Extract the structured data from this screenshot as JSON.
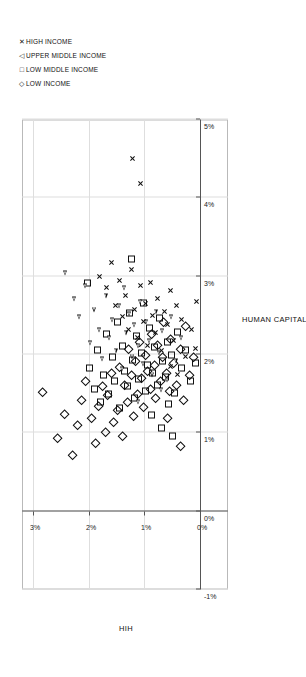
{
  "chart_data": {
    "type": "scatter",
    "title": "",
    "xlabel": "HUMAN CAPITAL PER CAPITA",
    "ylabel": "HIH",
    "xlim": [
      -0.01,
      0.05
    ],
    "ylim": [
      -0.005,
      0.032
    ],
    "xticks": [
      "-1%",
      "0%",
      "1%",
      "2%",
      "3%",
      "4%",
      "5%"
    ],
    "yticks": [
      "0%",
      "1%",
      "2%",
      "3%"
    ],
    "grid": true,
    "legend_position": "top-right",
    "series": [
      {
        "name": "LOW INCOME",
        "marker": "diamond",
        "color": "#111111",
        "points": [
          [
            0.015,
            0.0285
          ],
          [
            0.0092,
            0.0258
          ],
          [
            0.0123,
            0.0246
          ],
          [
            0.007,
            0.0232
          ],
          [
            0.0108,
            0.0222
          ],
          [
            0.014,
            0.0215
          ],
          [
            0.0165,
            0.0208
          ],
          [
            0.0118,
            0.0198
          ],
          [
            0.0085,
            0.019
          ],
          [
            0.0133,
            0.0185
          ],
          [
            0.0158,
            0.0178
          ],
          [
            0.01,
            0.0172
          ],
          [
            0.0147,
            0.0168
          ],
          [
            0.0175,
            0.0162
          ],
          [
            0.0112,
            0.0158
          ],
          [
            0.0128,
            0.015
          ],
          [
            0.0182,
            0.0147
          ],
          [
            0.0095,
            0.0142
          ],
          [
            0.016,
            0.0138
          ],
          [
            0.0138,
            0.0133
          ],
          [
            0.0205,
            0.013
          ],
          [
            0.0172,
            0.0126
          ],
          [
            0.012,
            0.0122
          ],
          [
            0.019,
            0.0118
          ],
          [
            0.0148,
            0.0115
          ],
          [
            0.0215,
            0.0112
          ],
          [
            0.0168,
            0.0108
          ],
          [
            0.0132,
            0.0104
          ],
          [
            0.0198,
            0.01
          ],
          [
            0.0178,
            0.0096
          ],
          [
            0.0155,
            0.0092
          ],
          [
            0.0225,
            0.009
          ],
          [
            0.0185,
            0.0085
          ],
          [
            0.0143,
            0.0082
          ],
          [
            0.021,
            0.0078
          ],
          [
            0.0165,
            0.0074
          ],
          [
            0.0195,
            0.007
          ],
          [
            0.024,
            0.0068
          ],
          [
            0.0175,
            0.0062
          ],
          [
            0.0152,
            0.0058
          ],
          [
            0.0218,
            0.0055
          ],
          [
            0.0188,
            0.005
          ],
          [
            0.016,
            0.0044
          ],
          [
            0.0205,
            0.0038
          ],
          [
            0.014,
            0.0032
          ],
          [
            0.0235,
            0.0028
          ],
          [
            0.0172,
            0.0022
          ],
          [
            0.0195,
            0.0014
          ],
          [
            0.0118,
            0.006
          ],
          [
            0.0082,
            0.0038
          ]
        ]
      },
      {
        "name": "LOW MIDDLE INCOME",
        "marker": "square",
        "color": "#111111",
        "points": [
          [
            0.029,
            0.0205
          ],
          [
            0.0182,
            0.02
          ],
          [
            0.0155,
            0.0192
          ],
          [
            0.0205,
            0.0186
          ],
          [
            0.0138,
            0.018
          ],
          [
            0.0172,
            0.0175
          ],
          [
            0.0225,
            0.017
          ],
          [
            0.0148,
            0.0166
          ],
          [
            0.0195,
            0.016
          ],
          [
            0.0165,
            0.0155
          ],
          [
            0.024,
            0.015
          ],
          [
            0.013,
            0.0146
          ],
          [
            0.021,
            0.0142
          ],
          [
            0.0178,
            0.0138
          ],
          [
            0.0158,
            0.0132
          ],
          [
            0.0252,
            0.0128
          ],
          [
            0.0192,
            0.0124
          ],
          [
            0.0143,
            0.012
          ],
          [
            0.0222,
            0.0116
          ],
          [
            0.0168,
            0.0112
          ],
          [
            0.02,
            0.0108
          ],
          [
            0.0265,
            0.0104
          ],
          [
            0.0152,
            0.01
          ],
          [
            0.0185,
            0.0096
          ],
          [
            0.0232,
            0.0092
          ],
          [
            0.0175,
            0.0088
          ],
          [
            0.0208,
            0.0084
          ],
          [
            0.016,
            0.0078
          ],
          [
            0.0245,
            0.0074
          ],
          [
            0.019,
            0.007
          ],
          [
            0.017,
            0.0064
          ],
          [
            0.0215,
            0.006
          ],
          [
            0.0198,
            0.0054
          ],
          [
            0.015,
            0.0048
          ],
          [
            0.0228,
            0.0042
          ],
          [
            0.0182,
            0.0036
          ],
          [
            0.0205,
            0.0028
          ],
          [
            0.0165,
            0.002
          ],
          [
            0.0188,
            0.001
          ],
          [
            0.0122,
            0.009
          ],
          [
            0.0105,
            0.0072
          ],
          [
            0.0135,
            0.0058
          ],
          [
            0.032,
            0.0125
          ],
          [
            0.0095,
            0.0052
          ]
        ]
      },
      {
        "name": "UPPER MIDDLE INCOME",
        "marker": "triangle",
        "color": "#111111",
        "points": [
          [
            0.0305,
            0.024
          ],
          [
            0.0272,
            0.0225
          ],
          [
            0.0248,
            0.0215
          ],
          [
            0.0288,
            0.0205
          ],
          [
            0.0215,
            0.0196
          ],
          [
            0.0258,
            0.0188
          ],
          [
            0.0232,
            0.018
          ],
          [
            0.0195,
            0.0174
          ],
          [
            0.0275,
            0.0168
          ],
          [
            0.0222,
            0.0162
          ],
          [
            0.0245,
            0.0156
          ],
          [
            0.0205,
            0.015
          ],
          [
            0.0262,
            0.0144
          ],
          [
            0.0182,
            0.0138
          ],
          [
            0.0228,
            0.0132
          ],
          [
            0.0252,
            0.0126
          ],
          [
            0.0198,
            0.012
          ],
          [
            0.0238,
            0.0116
          ],
          [
            0.0212,
            0.011
          ],
          [
            0.0268,
            0.0106
          ],
          [
            0.0188,
            0.01
          ],
          [
            0.0242,
            0.0095
          ],
          [
            0.0218,
            0.009
          ],
          [
            0.0175,
            0.0084
          ],
          [
            0.0255,
            0.0078
          ],
          [
            0.0202,
            0.0072
          ],
          [
            0.023,
            0.0066
          ],
          [
            0.0168,
            0.0058
          ],
          [
            0.0248,
            0.005
          ],
          [
            0.0192,
            0.0042
          ],
          [
            0.0222,
            0.0032
          ],
          [
            0.0155,
            0.0068
          ],
          [
            0.014,
            0.011
          ],
          [
            0.0285,
            0.0135
          ]
        ]
      },
      {
        "name": "HIGH INCOME",
        "marker": "x",
        "color": "#111111",
        "points": [
          [
            0.045,
            0.0122
          ],
          [
            0.0418,
            0.0108
          ],
          [
            0.03,
            0.018
          ],
          [
            0.0285,
            0.0168
          ],
          [
            0.0318,
            0.016
          ],
          [
            0.0262,
            0.0152
          ],
          [
            0.0295,
            0.0145
          ],
          [
            0.0248,
            0.014
          ],
          [
            0.0275,
            0.0134
          ],
          [
            0.0232,
            0.0128
          ],
          [
            0.0308,
            0.0124
          ],
          [
            0.0258,
            0.0118
          ],
          [
            0.0222,
            0.0112
          ],
          [
            0.0288,
            0.0108
          ],
          [
            0.0242,
            0.0102
          ],
          [
            0.0265,
            0.0098
          ],
          [
            0.0212,
            0.0094
          ],
          [
            0.0292,
            0.009
          ],
          [
            0.025,
            0.0086
          ],
          [
            0.0228,
            0.008
          ],
          [
            0.0272,
            0.0076
          ],
          [
            0.0205,
            0.007
          ],
          [
            0.0255,
            0.0064
          ],
          [
            0.0238,
            0.0058
          ],
          [
            0.0282,
            0.0054
          ],
          [
            0.0218,
            0.0048
          ],
          [
            0.0262,
            0.0042
          ],
          [
            0.0245,
            0.0034
          ],
          [
            0.0198,
            0.0026
          ],
          [
            0.0232,
            0.0016
          ],
          [
            0.0268,
            0.0006
          ],
          [
            0.0185,
            0.0054
          ],
          [
            0.0175,
            0.004
          ],
          [
            0.0208,
            0.0008
          ]
        ]
      }
    ]
  },
  "legend": {
    "items": [
      {
        "label": "LOW INCOME",
        "glyph": "◇",
        "marker": "diamond"
      },
      {
        "label": "LOW MIDDLE INCOME",
        "glyph": "□",
        "marker": "square"
      },
      {
        "label": "UPPER MIDDLE INCOME",
        "glyph": "◁",
        "marker": "triangle"
      },
      {
        "label": "HIGH INCOME",
        "glyph": "✕",
        "marker": "x"
      }
    ]
  }
}
